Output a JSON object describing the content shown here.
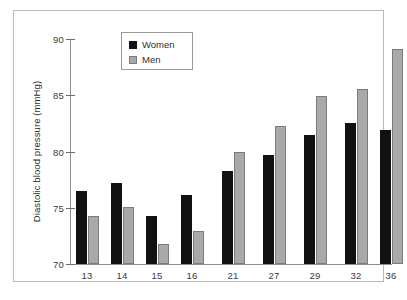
{
  "chart_data": {
    "type": "bar",
    "title": "",
    "xlabel": "",
    "ylabel": "Diastolic blood pressure (mmHg)",
    "ylim": [
      70,
      90
    ],
    "yticks": [
      70,
      75,
      80,
      85,
      90
    ],
    "ytick_labels": [
      "70",
      "75",
      "80",
      "85",
      "90"
    ],
    "grid": false,
    "legend_position": "top-left-inside",
    "categories": [
      "13",
      "14",
      "15",
      "16",
      "21",
      "27",
      "29",
      "32",
      "36"
    ],
    "series": [
      {
        "name": "Women",
        "color": "#111111",
        "values": [
          76.5,
          77.2,
          74.3,
          76.1,
          78.3,
          79.7,
          81.5,
          82.5,
          81.9
        ]
      },
      {
        "name": "Men",
        "color": "#a9a9a9",
        "values": [
          74.3,
          75.1,
          71.8,
          72.9,
          80.0,
          82.3,
          84.9,
          85.6,
          89.1
        ]
      }
    ]
  },
  "legend": {
    "items": [
      {
        "label": "Women",
        "swatch": "black-square"
      },
      {
        "label": "Men",
        "swatch": "gray-square"
      }
    ]
  },
  "axis": {
    "y_title": "Diastolic blood pressure (mmHg)"
  },
  "colors": {
    "women": "#111111",
    "men": "#a9a9a9",
    "axis": "#8d8d8d",
    "frame": "#b9b9b9",
    "text": "#2f2f2f",
    "background": "#ffffff"
  }
}
